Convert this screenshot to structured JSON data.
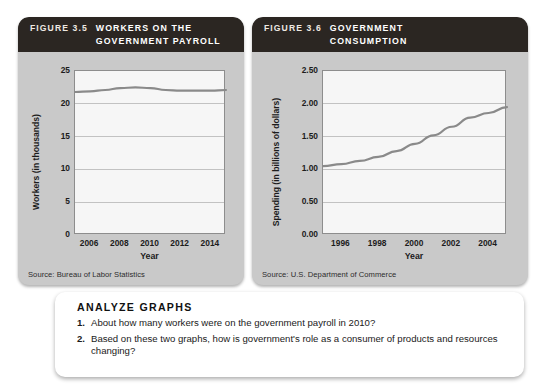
{
  "figures": [
    {
      "fignum": "FIGURE 3.5",
      "title": "WORKERS ON THE\nGOVERNMENT PAYROLL",
      "source": "Source: Bureau of Labor Statistics",
      "chart_data": {
        "type": "line",
        "title": "Workers on the Government Payroll",
        "xlabel": "Year",
        "ylabel": "Workers (in thousands)",
        "xticks": [
          "2006",
          "2008",
          "2010",
          "2012",
          "2014"
        ],
        "yticks": [
          "0",
          "5",
          "10",
          "15",
          "20",
          "25"
        ],
        "xlim": [
          2005,
          2015
        ],
        "ylim": [
          0,
          25
        ],
        "grid": true,
        "legend": "none",
        "x": [
          2005,
          2006,
          2007,
          2008,
          2009,
          2010,
          2011,
          2012,
          2013,
          2014,
          2015
        ],
        "values": [
          21.8,
          21.9,
          22.1,
          22.4,
          22.5,
          22.4,
          22.1,
          22.0,
          22.0,
          22.0,
          22.1
        ],
        "line_color": "#8a8a8a"
      }
    },
    {
      "fignum": "FIGURE 3.6",
      "title": "GOVERNMENT\nCONSUMPTION",
      "source": "Source: U.S. Department of Commerce",
      "chart_data": {
        "type": "line",
        "title": "Government Consumption",
        "xlabel": "Year",
        "ylabel": "Spending (in billions of dollars)",
        "xticks": [
          "1996",
          "1998",
          "2000",
          "2002",
          "2004"
        ],
        "yticks": [
          "0.00",
          "0.50",
          "1.00",
          "1.50",
          "2.00",
          "2.50"
        ],
        "xlim": [
          1995,
          2005
        ],
        "ylim": [
          0.0,
          2.5
        ],
        "grid": true,
        "legend": "none",
        "x": [
          1995,
          1996,
          1997,
          1998,
          1999,
          2000,
          2001,
          2002,
          2003,
          2004,
          2005
        ],
        "values": [
          1.05,
          1.08,
          1.13,
          1.19,
          1.28,
          1.39,
          1.52,
          1.65,
          1.79,
          1.86,
          1.95
        ],
        "line_color": "#8a8a8a"
      }
    }
  ],
  "analyze": {
    "title": "ANALYZE GRAPHS",
    "questions": [
      {
        "num": "1.",
        "text": "About how many workers were on the government payroll in 2010?"
      },
      {
        "num": "2.",
        "text": "Based on these two graphs, how is government's role as a consumer of products and resources changing?"
      }
    ]
  }
}
